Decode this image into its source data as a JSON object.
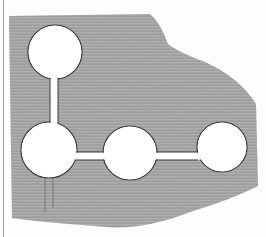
{
  "figure": {
    "description": "Engraved illustration of a flat plate with four circular holes connected by narrow slots",
    "colors": {
      "paper": "#fdfdfd",
      "plate_shade": "#a8a8a8",
      "hatch_line": "#6e6e6e",
      "hole": "#ffffff",
      "outline": "#3a3a3a",
      "border_line": "#9a9a9a"
    },
    "holes": [
      {
        "name": "top-left-hole",
        "cx": 55,
        "cy": 52,
        "r": 27
      },
      {
        "name": "bottom-left-hole",
        "cx": 49,
        "cy": 150,
        "r": 28
      },
      {
        "name": "middle-hole",
        "cx": 130,
        "cy": 153,
        "r": 27
      },
      {
        "name": "right-hole",
        "cx": 222,
        "cy": 147,
        "r": 25
      }
    ],
    "slots": [
      {
        "name": "vertical-slot",
        "x": 50,
        "y": 76,
        "w": 8,
        "h": 50
      },
      {
        "name": "horizontal-slot",
        "x": 74,
        "y": 152,
        "w": 128,
        "h": 8
      }
    ]
  }
}
